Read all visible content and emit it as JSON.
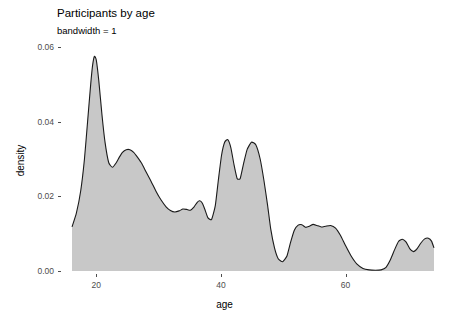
{
  "chart_data": {
    "type": "area",
    "title": "Participants by age",
    "subtitle": "bandwidth = 1",
    "xlabel": "age",
    "ylabel": "density",
    "grid": false,
    "legend": "none",
    "xlim": [
      16.1,
      74.2
    ],
    "ylim": [
      0.0,
      0.0635
    ],
    "xticks": [
      20,
      40,
      60
    ],
    "xtick_labels": [
      "20",
      "40",
      "60"
    ],
    "yticks": [
      0.0,
      0.02,
      0.04,
      0.06
    ],
    "ytick_labels": [
      "0.00",
      "0.02",
      "0.04",
      "0.06"
    ],
    "fill_color": "#c8c8c8",
    "line_color": "#1a1a1a",
    "background_color": "#ffffff",
    "series_name": "density",
    "x": [
      16.1,
      16.8,
      17.5,
      18.1,
      18.6,
      19.1,
      19.4,
      19.7,
      20.0,
      20.4,
      20.9,
      21.4,
      22.0,
      22.6,
      23.2,
      23.7,
      24.2,
      24.8,
      25.4,
      26.0,
      26.6,
      27.3,
      28.0,
      28.8,
      29.6,
      30.4,
      31.2,
      31.9,
      32.6,
      33.3,
      33.9,
      34.5,
      35.1,
      35.7,
      36.2,
      36.6,
      37.0,
      37.4,
      37.9,
      38.5,
      39.1,
      39.6,
      40.1,
      40.6,
      41.1,
      41.6,
      42.1,
      42.6,
      43.1,
      43.6,
      44.2,
      44.9,
      45.6,
      46.3,
      46.9,
      47.5,
      48.0,
      48.6,
      49.2,
      49.9,
      50.6,
      51.2,
      51.8,
      52.4,
      53.0,
      53.6,
      54.2,
      54.8,
      55.4,
      56.1,
      56.8,
      57.6,
      58.4,
      59.2,
      60.0,
      60.9,
      61.8,
      62.8,
      63.8,
      64.8,
      65.7,
      66.5,
      67.2,
      67.9,
      68.5,
      69.1,
      69.7,
      70.3,
      70.9,
      71.5,
      72.1,
      72.7,
      73.3,
      73.8,
      74.2
    ],
    "values": [
      0.0118,
      0.0155,
      0.0215,
      0.03,
      0.04,
      0.05,
      0.055,
      0.0575,
      0.0565,
      0.051,
      0.042,
      0.0345,
      0.029,
      0.0278,
      0.029,
      0.0305,
      0.0318,
      0.0325,
      0.0325,
      0.0318,
      0.0305,
      0.0288,
      0.0265,
      0.024,
      0.0213,
      0.019,
      0.0172,
      0.0162,
      0.0158,
      0.0161,
      0.0166,
      0.0165,
      0.0163,
      0.0172,
      0.0184,
      0.0188,
      0.0182,
      0.0166,
      0.0143,
      0.0138,
      0.0175,
      0.0245,
      0.031,
      0.0345,
      0.0352,
      0.033,
      0.0285,
      0.0248,
      0.0248,
      0.0285,
      0.0325,
      0.0345,
      0.0338,
      0.03,
      0.0243,
      0.0175,
      0.0112,
      0.0062,
      0.0033,
      0.0025,
      0.004,
      0.0078,
      0.011,
      0.0123,
      0.0124,
      0.0117,
      0.012,
      0.0125,
      0.0122,
      0.0118,
      0.012,
      0.0122,
      0.0115,
      0.0095,
      0.0068,
      0.004,
      0.0019,
      0.0007,
      0.0003,
      0.0002,
      0.0003,
      0.001,
      0.003,
      0.0058,
      0.0079,
      0.0085,
      0.0078,
      0.006,
      0.0052,
      0.006,
      0.0075,
      0.0086,
      0.0088,
      0.008,
      0.0062
    ]
  }
}
